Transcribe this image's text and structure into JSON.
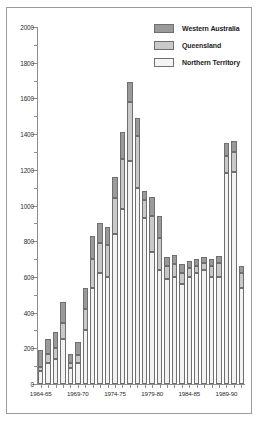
{
  "chart_data": {
    "type": "bar",
    "stacked": true,
    "title": "",
    "xlabel": "",
    "ylabel": "",
    "ylim": [
      0,
      2000
    ],
    "ytick_step": 200,
    "yminor_step": 100,
    "grid": false,
    "legend_position": "top-right",
    "ytick_labels": [
      "0",
      "200",
      "400",
      "600",
      "800",
      "1000",
      "1200",
      "1400",
      "1600",
      "1800",
      "2000"
    ],
    "categories": [
      "1964-65",
      "1965-66",
      "1966-67",
      "1967-68",
      "1968-69",
      "1969-70",
      "1970-71",
      "1971-72",
      "1972-73",
      "1973-74",
      "1974-75",
      "1975-76",
      "1976-77",
      "1977-78",
      "1978-79",
      "1979-80",
      "1980-81",
      "1981-82",
      "1982-83",
      "1983-84",
      "1984-85",
      "1985-86",
      "1986-87",
      "1987-88",
      "1988-89",
      "1989-90",
      "1990-91",
      "1991-92"
    ],
    "xtick_labels": [
      "1964-65",
      "1969-70",
      "1974-75",
      "1979-80",
      "1984-85",
      "1989-90"
    ],
    "xtick_indices": [
      0,
      5,
      10,
      15,
      20,
      25
    ],
    "series": [
      {
        "name": "Northern Territory",
        "color": "#f2f2f2",
        "values": [
          75,
          120,
          140,
          250,
          90,
          120,
          300,
          540,
          620,
          600,
          840,
          980,
          1250,
          1100,
          930,
          740,
          640,
          590,
          600,
          560,
          600,
          620,
          640,
          600,
          600,
          1180,
          1190,
          540
        ]
      },
      {
        "name": "Queensland",
        "color": "#c9c9c9",
        "values": [
          20,
          50,
          60,
          90,
          25,
          40,
          120,
          160,
          170,
          180,
          200,
          280,
          330,
          290,
          100,
          200,
          180,
          70,
          70,
          60,
          50,
          40,
          40,
          60,
          80,
          100,
          110,
          80
        ]
      },
      {
        "name": "Western Australia",
        "color": "#9a9a9a",
        "values": [
          95,
          80,
          90,
          120,
          55,
          75,
          120,
          130,
          110,
          100,
          120,
          150,
          110,
          100,
          50,
          110,
          120,
          50,
          50,
          50,
          40,
          40,
          30,
          40,
          40,
          70,
          60,
          40
        ]
      }
    ],
    "totals": [
      190,
      250,
      290,
      460,
      170,
      235,
      540,
      830,
      900,
      880,
      1160,
      1410,
      1690,
      1490,
      1080,
      1050,
      940,
      710,
      720,
      670,
      690,
      700,
      710,
      700,
      720,
      1350,
      1360,
      660
    ]
  },
  "legend": {
    "items": [
      {
        "label": "Western Australia",
        "key": "wa"
      },
      {
        "label": "Queensland",
        "key": "qld"
      },
      {
        "label": "Northern Territory",
        "key": "nt"
      }
    ]
  },
  "colors": {
    "western_australia": "#9a9a9a",
    "queensland": "#c9c9c9",
    "northern_territory": "#f2f2f2",
    "axis": "#8d8d8d",
    "frame": "#9a9a9a",
    "text": "#1d1d1d"
  }
}
